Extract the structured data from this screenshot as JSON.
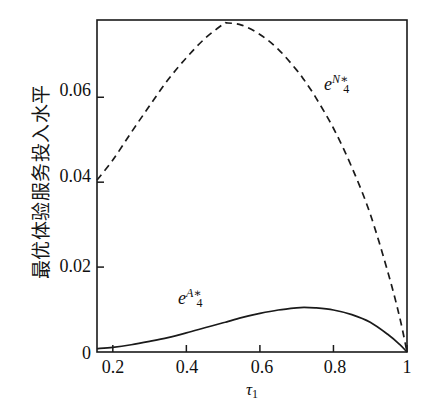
{
  "figure": {
    "background_color": "#ffffff",
    "ink_color": "#1a1a1a"
  },
  "axes": {
    "y_title": "最优体验服务投入水平",
    "x_title_symbol": "τ",
    "x_title_subscript": "1",
    "x_ticks": [
      "0.2",
      "0.4",
      "0.6",
      "0.8",
      "1"
    ],
    "y_ticks": [
      "0",
      "0.02",
      "0.04",
      "0.06"
    ]
  },
  "annotations": {
    "dashed_curve": {
      "base": "e",
      "sub": "4",
      "sup": "N∗"
    },
    "solid_curve": {
      "base": "e",
      "sub": "4",
      "sup": "A∗"
    }
  },
  "chart_data": {
    "type": "line",
    "title": "",
    "xlabel": "τ₁",
    "ylabel": "最优体验服务投入水平",
    "xlim": [
      0.157,
      1.0
    ],
    "ylim": [
      0.0,
      0.0782
    ],
    "grid": false,
    "legend": "inline-annotations",
    "x": [
      0.157,
      0.2,
      0.25,
      0.3,
      0.35,
      0.4,
      0.45,
      0.5,
      0.51,
      0.55,
      0.6,
      0.65,
      0.7,
      0.72,
      0.75,
      0.8,
      0.85,
      0.9,
      0.95,
      0.98,
      1.0
    ],
    "series": [
      {
        "name": "e4^{N*}",
        "label": "e₄^{N∗}",
        "style": "dashed",
        "color": "#1a1a1a",
        "values": [
          0.0405,
          0.0452,
          0.0517,
          0.058,
          0.0641,
          0.0693,
          0.0738,
          0.0772,
          0.0775,
          0.077,
          0.0748,
          0.0713,
          0.0664,
          0.0641,
          0.0602,
          0.0527,
          0.0435,
          0.0325,
          0.0182,
          0.0082,
          0.0
        ]
      },
      {
        "name": "e4^{A*}",
        "label": "e₄^{A∗}",
        "style": "solid",
        "color": "#1a1a1a",
        "values": [
          0.0008,
          0.0011,
          0.0017,
          0.0025,
          0.0034,
          0.0045,
          0.0057,
          0.0069,
          0.0071,
          0.0081,
          0.0091,
          0.0099,
          0.0104,
          0.0105,
          0.0104,
          0.0099,
          0.0088,
          0.007,
          0.004,
          0.0018,
          0.0
        ]
      }
    ],
    "notes": [
      "Dashed curve peaks at approximately (0.51, 0.0775), touching the top frame.",
      "Solid curve peaks at approximately (0.72, 0.0105).",
      "Both curves converge to 0 at tau_1 = 1."
    ]
  }
}
